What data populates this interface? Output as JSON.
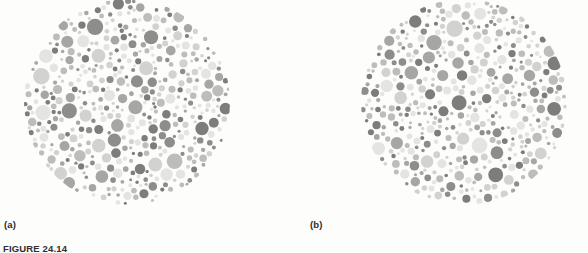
{
  "figure": {
    "caption": "FIGURE 24.14",
    "kind": "ishihara-color-vision-test-plates",
    "background_color": "#fdfdfc",
    "panels": [
      {
        "id": "a",
        "label": "(a)",
        "shape": "circle",
        "description": "Ishihara pseudoisochromatic plate rendered in grayscale; mosaic of randomly sized dots filling a circular field.",
        "plate_diameter_px": 206,
        "dot_count": 430,
        "dot_diameter_range_px": [
          3,
          17
        ],
        "dot_colors": [
          "#e4e4e0",
          "#d2d2ce",
          "#bdbdb9",
          "#a6a6a3",
          "#8d8d8b",
          "#7d7d7b"
        ],
        "cropped_edge": "top"
      },
      {
        "id": "b",
        "label": "(b)",
        "shape": "circle",
        "description": "Second Ishihara pseudoisochromatic plate rendered in grayscale; mosaic of randomly sized dots filling a circular field.",
        "plate_diameter_px": 206,
        "dot_count": 430,
        "dot_diameter_range_px": [
          3,
          17
        ],
        "dot_colors": [
          "#e4e4e0",
          "#d2d2ce",
          "#bdbdb9",
          "#a6a6a3",
          "#8d8d8b",
          "#7d7d7b"
        ],
        "cropped_edge": "top"
      }
    ]
  }
}
